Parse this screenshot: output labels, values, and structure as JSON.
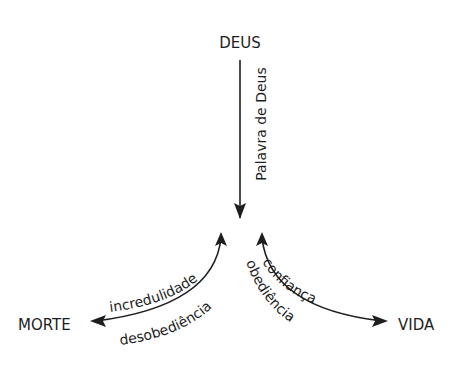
{
  "diagram": {
    "nodes": {
      "top": "DEUS",
      "left": "MORTE",
      "right": "VIDA"
    },
    "edges": {
      "vertical": {
        "label": "Palavra de Deus",
        "from": "DEUS",
        "direction": "down"
      },
      "left_upper": {
        "label": "incredulidade"
      },
      "left_lower": {
        "label": "desobediência"
      },
      "right_upper": {
        "label": "confiança"
      },
      "right_lower": {
        "label": "obediência"
      }
    },
    "colors": {
      "ink": "#1e1e1e",
      "background": "#ffffff"
    }
  }
}
